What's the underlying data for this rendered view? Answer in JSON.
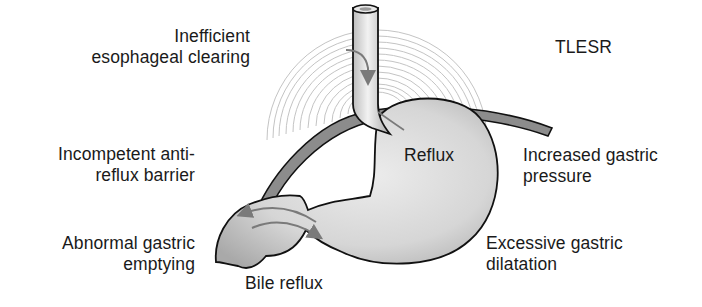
{
  "diagram": {
    "labels": {
      "inefficient_clearing": {
        "line1": "Inefficient",
        "line2": "esophageal clearing"
      },
      "tlesr": {
        "line1": "TLESR"
      },
      "incompetent_barrier": {
        "line1": "Incompetent anti-",
        "line2": "reflux barrier"
      },
      "reflux": {
        "line1": "Reflux"
      },
      "increased_pressure": {
        "line1": "Increased gastric",
        "line2": "pressure"
      },
      "abnormal_emptying": {
        "line1": "Abnormal gastric",
        "line2": "emptying"
      },
      "excessive_dilatation": {
        "line1": "Excessive gastric",
        "line2": "dilatation"
      },
      "bile_reflux": {
        "line1": "Bile reflux"
      }
    },
    "parts": [
      "esophagus",
      "diaphragm",
      "stomach",
      "duodenum",
      "TLESR concentric arcs",
      "reflux arrow",
      "bile reflux arrows",
      "esophageal clearing arrow"
    ],
    "colors": {
      "outline": "#111111",
      "stomach_fill": "#d9d9d9",
      "diaphragm_fill": "#8c8c8c",
      "arc_stroke": "#bdbdbd",
      "arrow": "#7a7a7a",
      "text": "#1a1a1a"
    }
  }
}
